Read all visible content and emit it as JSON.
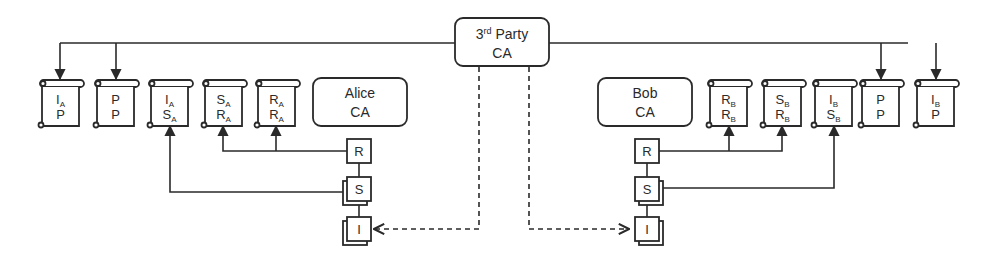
{
  "diagram": {
    "colors": {
      "stroke": "#2a2a2a",
      "background": "#ffffff"
    },
    "third_party_ca": {
      "line1": "3",
      "superscript": "rd",
      "line1_rest": " Party",
      "line2": "CA"
    },
    "alice_ca": {
      "line1": "Alice",
      "line2": "CA"
    },
    "bob_ca": {
      "line1": "Bob",
      "line2": "CA"
    },
    "alice_certificates": [
      {
        "subject": "I",
        "subject_sub": "A",
        "issuer": "P",
        "issuer_sub": ""
      },
      {
        "subject": "P",
        "subject_sub": "",
        "issuer": "P",
        "issuer_sub": ""
      },
      {
        "subject": "I",
        "subject_sub": "A",
        "issuer": "S",
        "issuer_sub": "A"
      },
      {
        "subject": "S",
        "subject_sub": "A",
        "issuer": "R",
        "issuer_sub": "A"
      },
      {
        "subject": "R",
        "subject_sub": "A",
        "issuer": "R",
        "issuer_sub": "A"
      }
    ],
    "bob_certificates": [
      {
        "subject": "R",
        "subject_sub": "B",
        "issuer": "R",
        "issuer_sub": "B"
      },
      {
        "subject": "S",
        "subject_sub": "B",
        "issuer": "R",
        "issuer_sub": "B"
      },
      {
        "subject": "I",
        "subject_sub": "B",
        "issuer": "S",
        "issuer_sub": "B"
      },
      {
        "subject": "P",
        "subject_sub": "",
        "issuer": "P",
        "issuer_sub": ""
      },
      {
        "subject": "I",
        "subject_sub": "B",
        "issuer": "P",
        "issuer_sub": ""
      }
    ],
    "alice_keys": {
      "root": "R",
      "signing": "S",
      "intermediate": "I"
    },
    "bob_keys": {
      "root": "R",
      "signing": "S",
      "intermediate": "I"
    }
  }
}
